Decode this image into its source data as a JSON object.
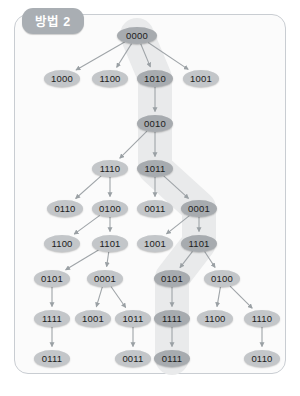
{
  "panel": {
    "badge_label": "방법 2",
    "border_color": "#c9cdd2",
    "background_color": "#fbfbfb",
    "badge_color": "#a9aeb3"
  },
  "diagram": {
    "type": "tree",
    "node_fill": "#c3c6c9",
    "node_fill_highlight": "#a7abaf",
    "highlight_band_color": "#e9eaeb",
    "edge_color": "#9fa4a8",
    "highlighted_path": [
      "0000",
      "1010",
      "0010",
      "1011",
      "0001",
      "1101",
      "0101",
      "1111",
      "0111"
    ],
    "levels": [
      {
        "y": 35,
        "nodes": [
          {
            "id": "n0",
            "label": "0000",
            "x": 137,
            "path": true,
            "root": true
          }
        ]
      },
      {
        "y": 78,
        "nodes": [
          {
            "id": "n1",
            "label": "1000",
            "x": 62,
            "path": false
          },
          {
            "id": "n2",
            "label": "1100",
            "x": 110,
            "path": false
          },
          {
            "id": "n3",
            "label": "1010",
            "x": 155,
            "path": true
          },
          {
            "id": "n4",
            "label": "1001",
            "x": 201,
            "path": false
          }
        ]
      },
      {
        "y": 123,
        "nodes": [
          {
            "id": "n5",
            "label": "0010",
            "x": 155,
            "path": true
          }
        ]
      },
      {
        "y": 168,
        "nodes": [
          {
            "id": "n6",
            "label": "1110",
            "x": 110,
            "path": false
          },
          {
            "id": "n7",
            "label": "1011",
            "x": 155,
            "path": true
          }
        ]
      },
      {
        "y": 208,
        "nodes": [
          {
            "id": "n8",
            "label": "0110",
            "x": 65,
            "path": false
          },
          {
            "id": "n9",
            "label": "0100",
            "x": 110,
            "path": false
          },
          {
            "id": "n10",
            "label": "0011",
            "x": 155,
            "path": false
          },
          {
            "id": "n11",
            "label": "0001",
            "x": 199,
            "path": true
          }
        ]
      },
      {
        "y": 243,
        "nodes": [
          {
            "id": "n12",
            "label": "1100",
            "x": 62,
            "path": false
          },
          {
            "id": "n13",
            "label": "1101",
            "x": 110,
            "path": false
          },
          {
            "id": "n14",
            "label": "1001",
            "x": 155,
            "path": false
          },
          {
            "id": "n15",
            "label": "1101",
            "x": 199,
            "path": true
          }
        ]
      },
      {
        "y": 278,
        "nodes": [
          {
            "id": "n16",
            "label": "0101",
            "x": 52,
            "path": false
          },
          {
            "id": "n17",
            "label": "0001",
            "x": 105,
            "path": false
          },
          {
            "id": "n18",
            "label": "0101",
            "x": 172,
            "path": true
          },
          {
            "id": "n19",
            "label": "0100",
            "x": 222,
            "path": false
          }
        ]
      },
      {
        "y": 318,
        "nodes": [
          {
            "id": "n20",
            "label": "1111",
            "x": 52,
            "path": false
          },
          {
            "id": "n21",
            "label": "1001",
            "x": 93,
            "path": false
          },
          {
            "id": "n22",
            "label": "1011",
            "x": 133,
            "path": false
          },
          {
            "id": "n23",
            "label": "1111",
            "x": 172,
            "path": true
          },
          {
            "id": "n24",
            "label": "1100",
            "x": 215,
            "path": false
          },
          {
            "id": "n25",
            "label": "1110",
            "x": 262,
            "path": false
          }
        ]
      },
      {
        "y": 358,
        "nodes": [
          {
            "id": "n26",
            "label": "0111",
            "x": 52,
            "path": false
          },
          {
            "id": "n27",
            "label": "0011",
            "x": 133,
            "path": false
          },
          {
            "id": "n28",
            "label": "0111",
            "x": 172,
            "path": true
          },
          {
            "id": "n29",
            "label": "0110",
            "x": 262,
            "path": false
          }
        ]
      }
    ],
    "edges": [
      [
        "n0",
        "n1"
      ],
      [
        "n0",
        "n2"
      ],
      [
        "n0",
        "n3"
      ],
      [
        "n0",
        "n4"
      ],
      [
        "n3",
        "n5"
      ],
      [
        "n5",
        "n6"
      ],
      [
        "n5",
        "n7"
      ],
      [
        "n6",
        "n8"
      ],
      [
        "n6",
        "n9"
      ],
      [
        "n7",
        "n10"
      ],
      [
        "n7",
        "n11"
      ],
      [
        "n9",
        "n12"
      ],
      [
        "n9",
        "n13"
      ],
      [
        "n11",
        "n14"
      ],
      [
        "n11",
        "n15"
      ],
      [
        "n13",
        "n16"
      ],
      [
        "n13",
        "n17"
      ],
      [
        "n15",
        "n18"
      ],
      [
        "n15",
        "n19"
      ],
      [
        "n16",
        "n20"
      ],
      [
        "n17",
        "n21"
      ],
      [
        "n17",
        "n22"
      ],
      [
        "n18",
        "n23"
      ],
      [
        "n19",
        "n24"
      ],
      [
        "n19",
        "n25"
      ],
      [
        "n20",
        "n26"
      ],
      [
        "n22",
        "n27"
      ],
      [
        "n23",
        "n28"
      ],
      [
        "n25",
        "n29"
      ]
    ]
  }
}
